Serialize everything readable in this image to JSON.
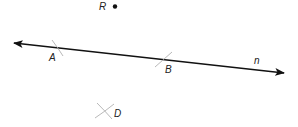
{
  "diagram": {
    "type": "geometry-construction",
    "line": {
      "name": "n",
      "label": "n",
      "color": "#111111",
      "arrows": "both"
    },
    "points": [
      {
        "id": "R",
        "label": "R",
        "marker": "dot",
        "on_line": false
      },
      {
        "id": "A",
        "label": "A",
        "marker": "arc-mark",
        "on_line": true
      },
      {
        "id": "B",
        "label": "B",
        "marker": "arc-mark",
        "on_line": true
      },
      {
        "id": "D",
        "label": "D",
        "marker": "arc-intersection",
        "on_line": false
      }
    ],
    "arc_color": "#b0b0b0"
  }
}
